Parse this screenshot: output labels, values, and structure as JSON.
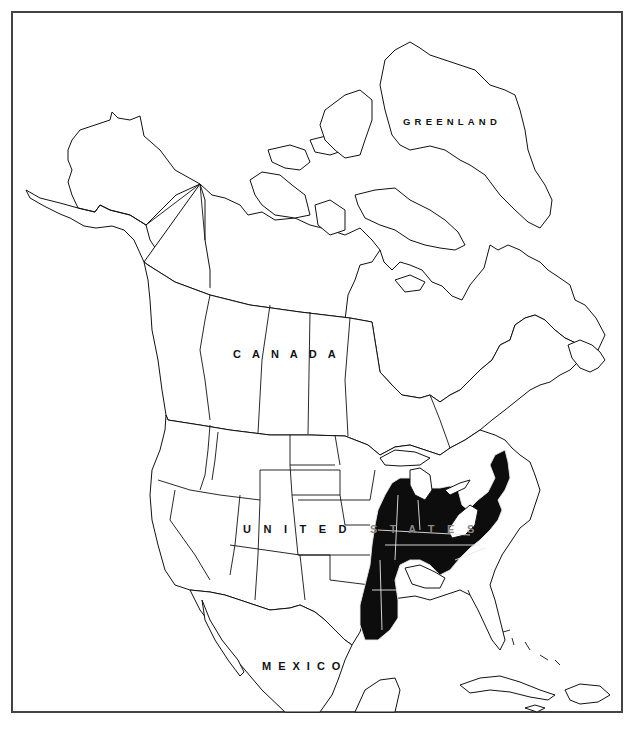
{
  "map": {
    "title": "Range map of North America",
    "type": "distribution range map",
    "labels": {
      "greenland": "GREENLAND",
      "canada": "CANADA",
      "united_states_part1": "UNITED",
      "united_states_part2": "STATES",
      "mexico": "MEXICO"
    },
    "shaded_region": {
      "description": "Eastern United States range (shaded black)",
      "fill_color": "#0d0d0d",
      "states_shaded": [
        "Louisiana",
        "Mississippi",
        "Arkansas (east)",
        "Missouri (east)",
        "Illinois",
        "Indiana",
        "Ohio",
        "Kentucky",
        "Tennessee",
        "Alabama (north)",
        "Pennsylvania",
        "New Jersey",
        "New York (southeast)",
        "Connecticut",
        "Virginia",
        "North Carolina",
        "South Carolina",
        "Maryland",
        "Delaware"
      ]
    },
    "colors": {
      "background": "#ffffff",
      "outline": "#111111",
      "frame": "#444444",
      "range_fill": "#0d0d0d"
    }
  }
}
